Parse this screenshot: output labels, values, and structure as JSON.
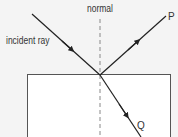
{
  "diagram": {
    "labels": {
      "incident_ray": "incident ray",
      "normal": "normal",
      "reflected_ray_end": "P",
      "refracted_ray_end": "Q"
    },
    "colors": {
      "background": "#f4f4f4",
      "block_fill": "#ffffff",
      "block_border": "#555555",
      "ray": "#222222",
      "normal_line": "#888888",
      "text": "#333333"
    },
    "geometry": {
      "point_of_incidence": [
        100,
        75
      ],
      "incident_ray": {
        "from": [
          32,
          14
        ],
        "to": [
          100,
          75
        ]
      },
      "reflected_ray": {
        "from": [
          100,
          75
        ],
        "to": [
          166,
          16
        ]
      },
      "refracted_ray": {
        "from": [
          100,
          75
        ],
        "to": [
          141,
          137
        ]
      },
      "normal_line": {
        "from": [
          100,
          19
        ],
        "to": [
          100,
          137
        ]
      },
      "block": {
        "x": 27,
        "y": 74,
        "width": 144
      }
    }
  }
}
